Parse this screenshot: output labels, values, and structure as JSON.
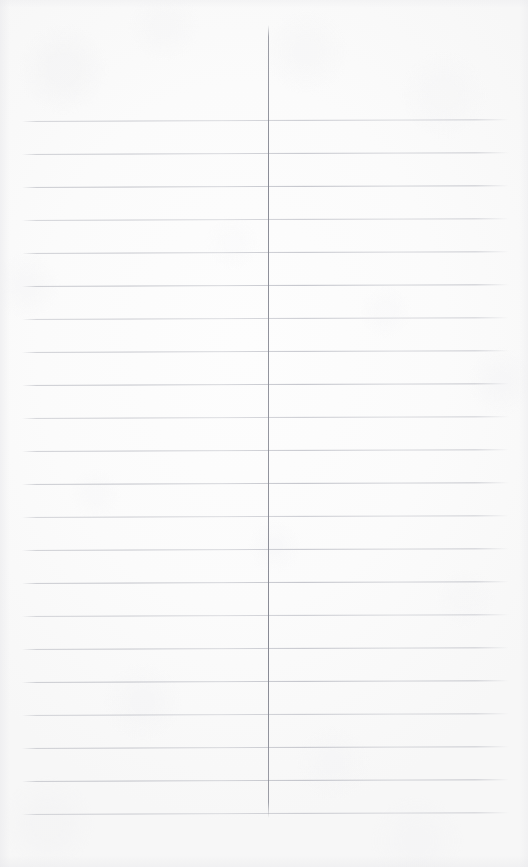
{
  "document": {
    "kind": "lined-notebook-page",
    "title": "Blank ruled page",
    "page_width": 528,
    "page_height": 867,
    "has_visible_text": false,
    "paper_color": "#fbfbfb",
    "rule_color": "#aeb0b8",
    "margin_rule_color": "#888a95"
  },
  "ruling": {
    "line_count": 22,
    "first_line_y": 121,
    "line_spacing": 33,
    "line_start_x": 22,
    "line_end_x": 509,
    "line_thickness": 1,
    "tilt_degrees": -0.22,
    "lines_y": [
      121,
      154,
      187,
      220,
      253,
      286,
      319,
      352,
      385,
      418,
      451,
      484,
      517,
      550,
      583,
      616,
      649,
      682,
      715,
      748,
      781,
      814
    ]
  },
  "margin_rule": {
    "x": 268,
    "top_y": 25,
    "bottom_y": 818,
    "thickness": 1,
    "orientation": "vertical"
  },
  "content": {
    "written_text": "",
    "notes": ""
  }
}
